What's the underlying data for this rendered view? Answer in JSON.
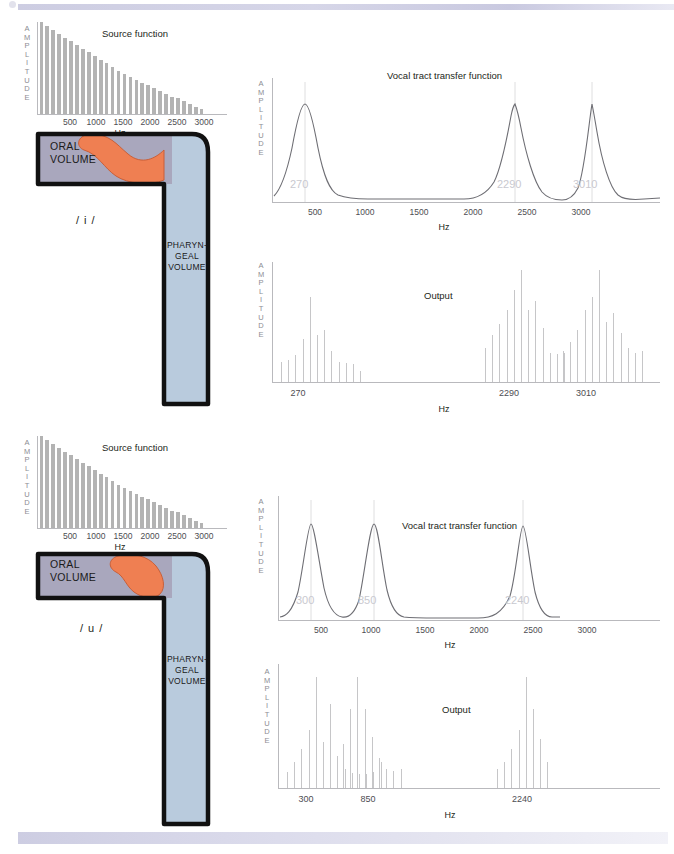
{
  "page": {
    "background": "#ffffff",
    "rule_color": "#cdcde2"
  },
  "palette": {
    "oral_volume": "#a9a7bd",
    "pharyngeal_volume": "#b9cbdd",
    "tongue": "#ef7f52",
    "outline": "#111111",
    "source_bar": "#b3b3b3",
    "output_bar": "#c6c6c8",
    "curve": "#6e6e74",
    "formant_label": "#c9c9cf",
    "axis": "#b9b9bd"
  },
  "axis_labels": {
    "amplitude": "AMPLITUDE",
    "hz": "Hz"
  },
  "panels": {
    "top": {
      "vowel": "/ i /",
      "tract": {
        "oral_label_line1": "ORAL",
        "oral_label_line2": "VOLUME",
        "pharyngeal_label_line1": "PHARYN-",
        "pharyngeal_label_line2": "GEAL",
        "pharyngeal_label_line3": "VOLUME"
      },
      "source": {
        "title": "Source function",
        "xlabel": "Hz",
        "ylabel": "AMPLITUDE",
        "ticks": [
          "500",
          "1000",
          "1500",
          "2000",
          "2500",
          "3000"
        ]
      },
      "transfer": {
        "title": "Vocal tract transfer function",
        "xlabel": "Hz",
        "ylabel": "AMPLITUDE",
        "ticks": [
          "500",
          "1000",
          "1500",
          "2000",
          "2500",
          "3000"
        ],
        "formants": [
          "270",
          "2290",
          "3010"
        ]
      },
      "output": {
        "title": "Output",
        "xlabel": "Hz",
        "ylabel": "AMPLITUDE",
        "ticks": [
          "270",
          "2290",
          "3010"
        ]
      }
    },
    "bottom": {
      "vowel": "/ u /",
      "tract": {
        "oral_label_line1": "ORAL",
        "oral_label_line2": "VOLUME",
        "pharyngeal_label_line1": "PHARYN-",
        "pharyngeal_label_line2": "GEAL",
        "pharyngeal_label_line3": "VOLUME"
      },
      "source": {
        "title": "Source function",
        "xlabel": "Hz",
        "ylabel": "AMPLITUDE",
        "ticks": [
          "500",
          "1000",
          "1500",
          "2000",
          "2500",
          "3000"
        ]
      },
      "transfer": {
        "title": "Vocal tract transfer function",
        "xlabel": "Hz",
        "ylabel": "AMPLITUDE",
        "ticks": [
          "500",
          "1000",
          "1500",
          "2000",
          "2500",
          "3000"
        ],
        "formants": [
          "300",
          "850",
          "2240"
        ]
      },
      "output": {
        "title": "Output",
        "xlabel": "Hz",
        "ylabel": "AMPLITUDE",
        "ticks": [
          "300",
          "850",
          "2240"
        ]
      }
    }
  },
  "chart_data": [
    {
      "id": "source-i",
      "type": "bar",
      "title": "Source function",
      "xlabel": "Hz",
      "ylabel": "AMPLITUDE",
      "xlim": [
        0,
        3200
      ],
      "ylim": [
        0,
        100
      ],
      "grid": false,
      "x": [
        100,
        200,
        300,
        400,
        500,
        600,
        700,
        800,
        900,
        1000,
        1100,
        1200,
        1300,
        1400,
        1500,
        1600,
        1700,
        1800,
        1900,
        2000,
        2100,
        2200,
        2300,
        2400,
        2500,
        2600,
        2700,
        2800
      ],
      "values": [
        100,
        96,
        91,
        87,
        83,
        79,
        75,
        71,
        67,
        63,
        59,
        55,
        51,
        47,
        44,
        40,
        37,
        34,
        31,
        28,
        25,
        22,
        19,
        17,
        14,
        11,
        8,
        5
      ]
    },
    {
      "id": "transfer-i",
      "type": "line",
      "title": "Vocal tract transfer function",
      "xlabel": "Hz",
      "ylabel": "AMPLITUDE",
      "xlim": [
        0,
        3300
      ],
      "ylim": [
        0,
        100
      ],
      "grid": false,
      "formant_frequencies": [
        270,
        2290,
        3010
      ],
      "formant_labels": [
        "270",
        "2290",
        "3010"
      ],
      "peak_amplitudes": [
        100,
        100,
        100
      ],
      "bandwidths": [
        90,
        110,
        120
      ]
    },
    {
      "id": "output-i",
      "type": "bar",
      "title": "Output",
      "xlabel": "Hz",
      "ylabel": "AMPLITUDE",
      "grid": false,
      "tick_labels": [
        "270",
        "2290",
        "3010"
      ],
      "groups": [
        {
          "center_label": "270",
          "values": [
            18,
            20,
            24,
            38,
            76,
            42,
            46,
            28,
            18,
            17,
            16,
            10
          ]
        },
        {
          "center_label": "2290",
          "values": [
            30,
            42,
            52,
            64,
            82,
            100,
            64,
            72,
            48,
            26,
            25,
            26
          ]
        },
        {
          "center_label": "3010",
          "values": [
            28,
            36,
            46,
            64,
            76,
            100,
            54,
            62,
            44,
            30,
            26,
            28
          ]
        }
      ]
    },
    {
      "id": "source-u",
      "type": "bar",
      "title": "Source function",
      "xlabel": "Hz",
      "ylabel": "AMPLITUDE",
      "xlim": [
        0,
        3200
      ],
      "ylim": [
        0,
        100
      ],
      "grid": false,
      "x": [
        100,
        200,
        300,
        400,
        500,
        600,
        700,
        800,
        900,
        1000,
        1100,
        1200,
        1300,
        1400,
        1500,
        1600,
        1700,
        1800,
        1900,
        2000,
        2100,
        2200,
        2300,
        2400,
        2500,
        2600,
        2700,
        2800
      ],
      "values": [
        100,
        96,
        91,
        87,
        83,
        79,
        75,
        71,
        67,
        63,
        59,
        55,
        51,
        47,
        44,
        40,
        37,
        34,
        31,
        28,
        25,
        22,
        19,
        17,
        14,
        11,
        8,
        5
      ]
    },
    {
      "id": "transfer-u",
      "type": "line",
      "title": "Vocal tract transfer function",
      "xlabel": "Hz",
      "ylabel": "AMPLITUDE",
      "xlim": [
        0,
        3300
      ],
      "ylim": [
        0,
        100
      ],
      "grid": false,
      "formant_frequencies": [
        300,
        850,
        2240
      ],
      "formant_labels": [
        "300",
        "850",
        "2240"
      ],
      "peak_amplitudes": [
        100,
        100,
        100
      ],
      "bandwidths": [
        95,
        85,
        100
      ]
    },
    {
      "id": "output-u",
      "type": "bar",
      "title": "Output",
      "xlabel": "Hz",
      "ylabel": "AMPLITUDE",
      "grid": false,
      "tick_labels": [
        "300",
        "850",
        "2240"
      ],
      "groups": [
        {
          "center_label": "300",
          "values": [
            14,
            22,
            34,
            50,
            96,
            40,
            72,
            28,
            16,
            13,
            12,
            12,
            14,
            22
          ]
        },
        {
          "center_label": "850",
          "values": [
            38,
            68,
            96,
            68,
            44,
            26,
            16,
            15,
            16
          ]
        },
        {
          "center_label": "2240",
          "values": [
            16,
            22,
            34,
            50,
            96,
            68,
            42,
            22
          ]
        }
      ]
    }
  ]
}
